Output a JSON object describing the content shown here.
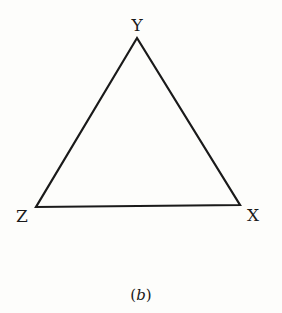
{
  "figure": {
    "caption_open": "(",
    "caption_letter": "b",
    "caption_close": ")",
    "colors": {
      "background": "#fdfdfb",
      "stroke": "#1a1a1a"
    },
    "vertices": [
      {
        "label": "Y",
        "x": 137,
        "y": 38
      },
      {
        "label": "X",
        "x": 240,
        "y": 205
      },
      {
        "label": "Z",
        "x": 36,
        "y": 207
      }
    ],
    "labels": {
      "y": "Y",
      "x": "X",
      "z": "Z"
    }
  }
}
